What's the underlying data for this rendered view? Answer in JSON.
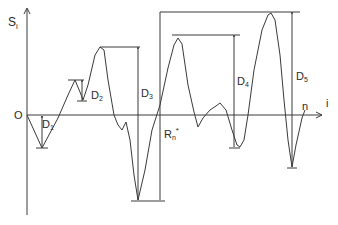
{
  "diagram": {
    "y_axis_label": "S",
    "y_axis_sub": "i",
    "origin_label": "O",
    "x_axis_label": "i",
    "end_label": "n",
    "drawdowns": [
      {
        "name": "D",
        "sub": "1"
      },
      {
        "name": "D",
        "sub": "2"
      },
      {
        "name": "D",
        "sub": "3"
      },
      {
        "name": "D",
        "sub": "4"
      },
      {
        "name": "D",
        "sub": "5"
      }
    ],
    "range_label": "R",
    "range_sub": "n",
    "range_sup": "*",
    "colors": {
      "ink": "#3a3a3a",
      "background": "#ffffff"
    }
  }
}
